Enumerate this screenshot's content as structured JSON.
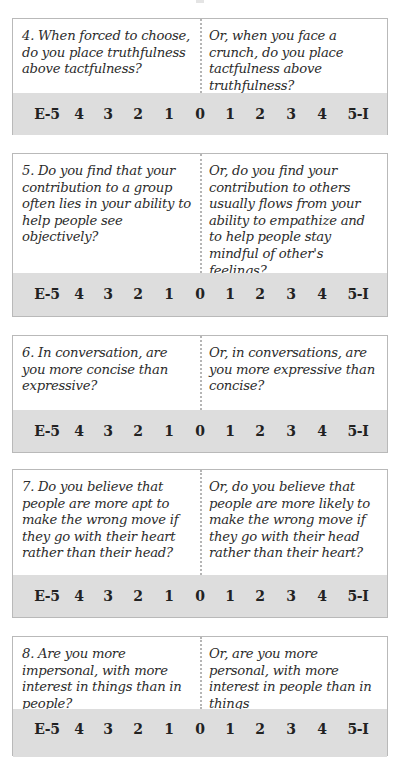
{
  "scale_labels": [
    "E-5",
    "4",
    "3",
    "2",
    "1",
    "0",
    "1",
    "2",
    "3",
    "4",
    "5-I"
  ],
  "colors": {
    "scale_background": "#dddddd",
    "border": "#b9b9b9",
    "divider": "#b5b5b5",
    "text": "#2c2c2c"
  },
  "questions": [
    {
      "left": "4. When forced to choose, do you place truthfulness above tactfulness?",
      "right": "Or, when you face a crunch, do you place tactfulness above truthfulness?"
    },
    {
      "left": "5. Do you find that your contribution to a group often lies in your ability to help people see objectively?",
      "right": "Or, do you find your contribution to others usually flows from your ability to empathize and to help people stay mindful of other's feelings?"
    },
    {
      "left": "6. In conversation, are you more concise than expressive?",
      "right": "Or, in conversations, are you more expressive than concise?"
    },
    {
      "left": "7. Do you believe that people are more apt to make the wrong move if they go with their heart rather than their head?",
      "right": "Or, do you believe that people are more likely to make the wrong move if they go with their head rather than their heart?"
    },
    {
      "left": "8. Are you more impersonal, with more interest in things than in people?",
      "right": "Or, are you more personal, with more interest in people than in things"
    }
  ]
}
